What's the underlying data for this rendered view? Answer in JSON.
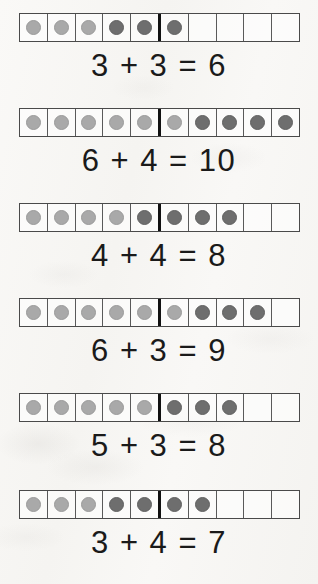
{
  "worksheet": {
    "title": "Ten Frame Addition Worksheet",
    "frame_size": 10,
    "divider_after_cell": 5,
    "colors": {
      "background": "#f8f7f5",
      "grid_border": "#4a4a4a",
      "cell_line": "#5a5a5a",
      "divider": "#111111",
      "dot_light": "#a9a9a9",
      "dot_dark": "#6e6e6e",
      "text": "#1a1a1a"
    },
    "problems": [
      {
        "index": 1,
        "addend_light": 3,
        "addend_dark": 3,
        "sum": 6,
        "empty_cells": 4,
        "equation": "3 + 3 = 6"
      },
      {
        "index": 2,
        "addend_light": 6,
        "addend_dark": 4,
        "sum": 10,
        "empty_cells": 0,
        "equation": "6 + 4 = 10"
      },
      {
        "index": 3,
        "addend_light": 4,
        "addend_dark": 4,
        "sum": 8,
        "empty_cells": 2,
        "equation": "4 + 4 = 8"
      },
      {
        "index": 4,
        "addend_light": 6,
        "addend_dark": 3,
        "sum": 9,
        "empty_cells": 1,
        "equation": "6 + 3 = 9"
      },
      {
        "index": 5,
        "addend_light": 5,
        "addend_dark": 3,
        "sum": 8,
        "empty_cells": 2,
        "equation": "5 + 3 = 8"
      },
      {
        "index": 6,
        "addend_light": 3,
        "addend_dark": 4,
        "sum": 7,
        "empty_cells": 3,
        "equation": "3 + 4 = 7"
      }
    ]
  }
}
